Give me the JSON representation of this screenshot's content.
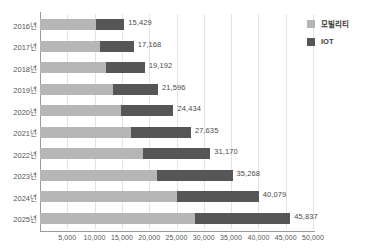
{
  "chart_data": {
    "type": "bar",
    "orientation": "horizontal",
    "stacked": true,
    "title": "",
    "subtitle": "",
    "xlabel": "",
    "ylabel": "",
    "xlim": [
      0,
      50000
    ],
    "grid": true,
    "legend_position": "right-top",
    "categories": [
      "2016년",
      "2017년",
      "2018년",
      "2019년",
      "2020년",
      "2021년",
      "2022년",
      "2023년",
      "2024년",
      "2025년"
    ],
    "xticks": [
      "5,000",
      "10,000",
      "15,000",
      "20,000",
      "25,000",
      "30,000",
      "35,000",
      "40,000",
      "45,000",
      "50,000"
    ],
    "xtick_values": [
      5000,
      10000,
      15000,
      20000,
      25000,
      30000,
      35000,
      40000,
      45000,
      50000
    ],
    "series": [
      {
        "name": "모빌리티",
        "color": "#b6b6b6",
        "values": [
          10300,
          11000,
          12000,
          13400,
          14900,
          16700,
          18900,
          21500,
          25100,
          28400
        ]
      },
      {
        "name": "IOT",
        "color": "#565656",
        "values": [
          5129,
          6168,
          7192,
          8196,
          9534,
          10935,
          12270,
          13768,
          14979,
          17437
        ]
      }
    ],
    "totals": [
      15429,
      17168,
      19192,
      21596,
      24434,
      27635,
      31170,
      35268,
      40079,
      45837
    ],
    "total_labels": [
      "15,429",
      "17,168",
      "19,192",
      "21,596",
      "24,434",
      "27,635",
      "31,170",
      "35,268",
      "40,079",
      "45,837"
    ]
  },
  "legend": {
    "items": [
      {
        "label": "모빌리티",
        "color": "#b6b6b6"
      },
      {
        "label": "IOT",
        "color": "#565656"
      }
    ]
  }
}
